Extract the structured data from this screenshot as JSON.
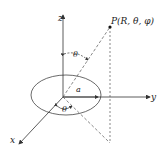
{
  "diagram": {
    "axes": {
      "x": "x",
      "y": "y",
      "z": "z"
    },
    "point_label": "P(R, θ, φ)",
    "radius_label": "a",
    "polar_angle_label": "θ",
    "azimuth_angle_label": "θ",
    "colors": {
      "line": "#333333",
      "background": "#ffffff"
    }
  }
}
